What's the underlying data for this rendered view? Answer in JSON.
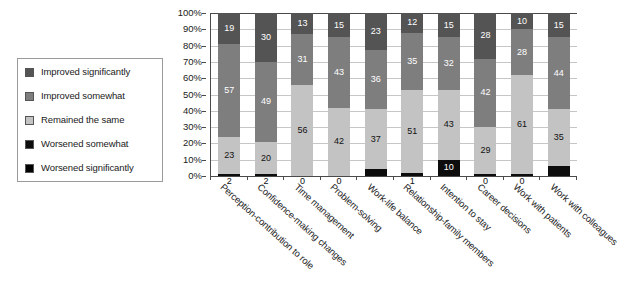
{
  "chart_data": {
    "type": "bar",
    "subtype": "stacked-percentage-column",
    "title": "",
    "subtitle": "",
    "xlabel": "",
    "ylabel": "",
    "ylim": [
      0,
      100
    ],
    "grid": true,
    "legend_position": "left",
    "y_ticks": [
      "0%",
      "10%",
      "20%",
      "30%",
      "40%",
      "50%",
      "60%",
      "70%",
      "80%",
      "90%",
      "100%"
    ],
    "categories": [
      "Perception-contribution to role",
      "Confidence-making changes",
      "Time management",
      "Problem-solving",
      "Work-life balance",
      "Relationship-family members",
      "Intention to stay",
      "Career decisions",
      "Work with patients",
      "Work with colleagues"
    ],
    "series": [
      {
        "name": "Improved significantly",
        "color": "#545454",
        "values": [
          19,
          30,
          13,
          15,
          23,
          12,
          15,
          28,
          10,
          15
        ]
      },
      {
        "name": "Improved somewhat",
        "color": "#7e7e7e",
        "values": [
          57,
          49,
          31,
          43,
          36,
          35,
          32,
          42,
          28,
          44
        ]
      },
      {
        "name": "Remained the same",
        "color": "#c3c3c3",
        "values": [
          23,
          20,
          56,
          42,
          37,
          51,
          43,
          29,
          61,
          35
        ]
      },
      {
        "name": "Worsened somewhat",
        "color": "#0d0d0d",
        "values": [
          1,
          1,
          0,
          0,
          2,
          1,
          5,
          1,
          1,
          1
        ]
      },
      {
        "name": "Worsened significantly",
        "color": "#000000",
        "values": [
          1,
          1,
          0,
          0,
          2,
          0,
          5,
          0,
          0,
          1
        ]
      }
    ],
    "data_labels": [
      {
        "category": "Perception-contribution to role",
        "labels": [
          "19",
          "57",
          "23",
          "2"
        ]
      },
      {
        "category": "Confidence-making changes",
        "labels": [
          "30",
          "49",
          "20",
          "2"
        ]
      },
      {
        "category": "Time management",
        "labels": [
          "13",
          "31",
          "56",
          "0"
        ]
      },
      {
        "category": "Problem-solving",
        "labels": [
          "15",
          "43",
          "42",
          "0"
        ]
      },
      {
        "category": "Work-life balance",
        "labels": [
          "23",
          "36",
          "37",
          ""
        ]
      },
      {
        "category": "Relationship-family members",
        "labels": [
          "12",
          "35",
          "51",
          "1"
        ]
      },
      {
        "category": "Intention to stay",
        "labels": [
          "15",
          "32",
          "43",
          "10"
        ]
      },
      {
        "category": "Career decisions",
        "labels": [
          "28",
          "42",
          "29",
          "0"
        ]
      },
      {
        "category": "Work with patients",
        "labels": [
          "10",
          "28",
          "61",
          "0"
        ]
      },
      {
        "category": "Work with colleagues",
        "labels": [
          "15",
          "44",
          "35",
          ""
        ]
      }
    ],
    "bar_segments": [
      {
        "values": [
          19,
          57,
          23,
          1
        ],
        "labels": [
          "19",
          "57",
          "23",
          "2"
        ],
        "label_below": true
      },
      {
        "values": [
          30,
          49,
          20,
          1
        ],
        "labels": [
          "30",
          "49",
          "20",
          "2"
        ],
        "label_below": true
      },
      {
        "values": [
          13,
          31,
          56,
          0
        ],
        "labels": [
          "13",
          "31",
          "56",
          "0"
        ],
        "label_below": true
      },
      {
        "values": [
          15,
          43,
          42,
          0
        ],
        "labels": [
          "15",
          "43",
          "42",
          "0"
        ],
        "label_below": true
      },
      {
        "values": [
          23,
          36,
          37,
          4
        ],
        "labels": [
          "23",
          "36",
          "37",
          ""
        ],
        "label_below": false
      },
      {
        "values": [
          12,
          35,
          51,
          2
        ],
        "labels": [
          "12",
          "35",
          "51",
          "1"
        ],
        "label_below": true
      },
      {
        "values": [
          15,
          32,
          43,
          10
        ],
        "labels": [
          "15",
          "32",
          "43",
          "10"
        ],
        "label_below": false
      },
      {
        "values": [
          28,
          42,
          29,
          1
        ],
        "labels": [
          "28",
          "42",
          "29",
          "0"
        ],
        "label_below": true
      },
      {
        "values": [
          10,
          28,
          61,
          1
        ],
        "labels": [
          "10",
          "28",
          "61",
          "0"
        ],
        "label_below": true
      },
      {
        "values": [
          15,
          44,
          35,
          6
        ],
        "labels": [
          "15",
          "44",
          "35",
          ""
        ],
        "label_below": false
      }
    ]
  },
  "legend": {
    "items": [
      {
        "label": "Improved significantly",
        "color": "#545454"
      },
      {
        "label": "Improved somewhat",
        "color": "#7e7e7e"
      },
      {
        "label": "Remained the same",
        "color": "#c3c3c3"
      },
      {
        "label": "Worsened somewhat",
        "color": "#0d0d0d"
      },
      {
        "label": "Worsened significantly",
        "color": "#000000"
      }
    ]
  }
}
